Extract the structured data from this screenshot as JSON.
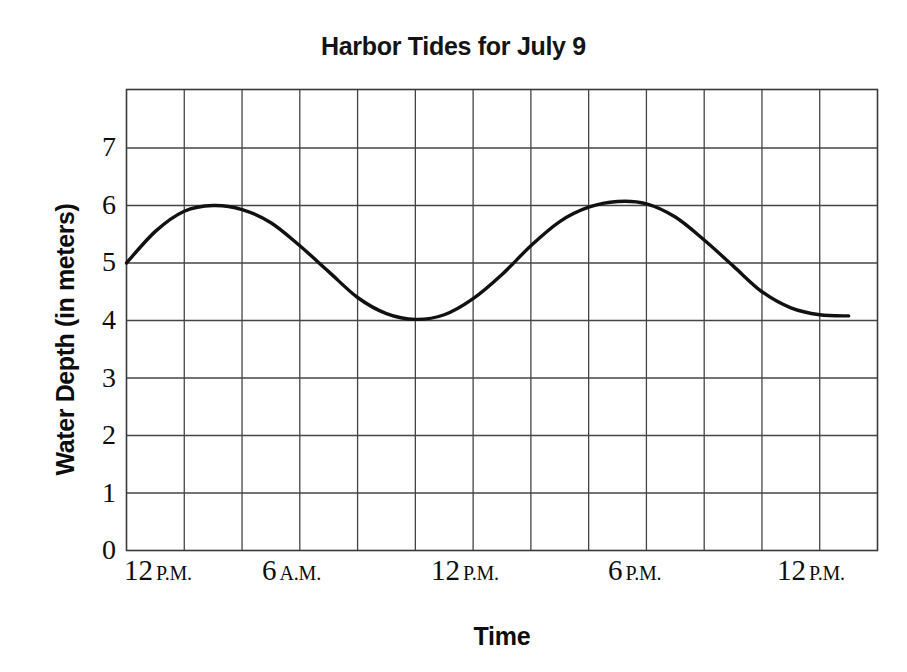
{
  "chart_data": {
    "type": "line",
    "title": "Harbor Tides for July 9",
    "xlabel": "Time",
    "ylabel": "Water Depth (in meters)",
    "ylim": [
      0,
      8
    ],
    "xlim": [
      0,
      26
    ],
    "grid": true,
    "legend": "none",
    "y_ticks": [
      "0",
      "1",
      "2",
      "3",
      "4",
      "5",
      "6",
      "7"
    ],
    "y_tick_values": [
      0,
      1,
      2,
      3,
      4,
      5,
      6,
      7
    ],
    "x_tick_labels": [
      {
        "num": "12",
        "mer": "P.M."
      },
      {
        "num": "6",
        "mer": "A.M."
      },
      {
        "num": "12",
        "mer": "P.M."
      },
      {
        "num": "6",
        "mer": "P.M."
      },
      {
        "num": "12",
        "mer": "P.M."
      }
    ],
    "x_tick_hours": [
      0,
      6,
      12,
      18,
      24
    ],
    "series": [
      {
        "name": "Water depth",
        "color": "#111111",
        "x": [
          0,
          1,
          2,
          3,
          4,
          5,
          6,
          7,
          8,
          9,
          10,
          11,
          12,
          13,
          14,
          15,
          16,
          17,
          18,
          19,
          20,
          21,
          22,
          23,
          24,
          25
        ],
        "values": [
          5.0,
          5.55,
          5.9,
          6.0,
          5.93,
          5.7,
          5.3,
          4.85,
          4.4,
          4.12,
          4.02,
          4.1,
          4.38,
          4.8,
          5.3,
          5.72,
          5.97,
          6.07,
          6.03,
          5.8,
          5.4,
          4.95,
          4.5,
          4.22,
          4.1,
          4.08
        ]
      }
    ],
    "annotations": {
      "first_peak": {
        "x_hour": 3,
        "value": 6.0
      },
      "first_trough": {
        "x_hour": 10,
        "value": 4.0
      },
      "second_peak": {
        "x_hour": 17,
        "value": 6.05
      },
      "start_value": 5.0,
      "end_value": 4.08
    },
    "gridline_columns": 13,
    "gridline_rows": 8
  }
}
